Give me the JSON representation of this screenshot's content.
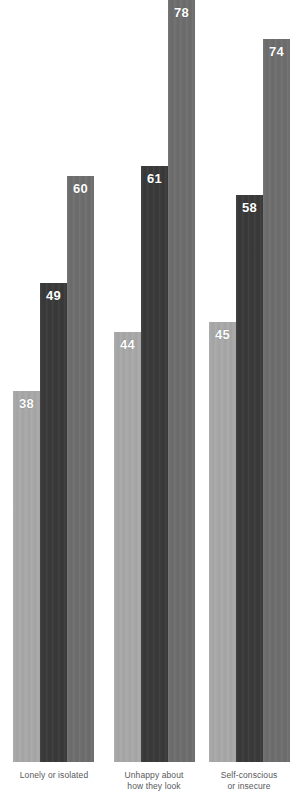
{
  "chart_data": {
    "type": "bar",
    "title": "",
    "subtitle": "",
    "xlabel": "",
    "ylabel": "",
    "ylim": [
      0,
      78
    ],
    "grid": false,
    "legend_position": "none",
    "orientation": "vertical",
    "grouped": true,
    "categories": [
      "Lonely or isolated",
      "Unhappy about how they look",
      "Self-conscious or insecure"
    ],
    "category_lines": [
      [
        "Lonely or isolated"
      ],
      [
        "Unhappy about",
        "how they look"
      ],
      [
        "Self-conscious",
        "or insecure"
      ]
    ],
    "series": [
      {
        "name": "series-1",
        "color": "#a8a8a8",
        "values": [
          38,
          44,
          45
        ]
      },
      {
        "name": "series-2",
        "color": "#3a3a3a",
        "values": [
          49,
          61,
          58
        ]
      },
      {
        "name": "series-3",
        "color": "#6e6e6e",
        "values": [
          60,
          78,
          74
        ]
      }
    ],
    "data_labels": [
      "38",
      "49",
      "60",
      "44",
      "61",
      "78",
      "45",
      "58",
      "74"
    ]
  },
  "groups": [
    {
      "label_lines": [
        "Lonely or isolated"
      ],
      "label_left": 0,
      "label_width": 108,
      "group_left": 13,
      "bars": [
        {
          "value": 38,
          "label": "38",
          "color": "#a8a8a8",
          "left": 0
        },
        {
          "value": 49,
          "label": "49",
          "color": "#3a3a3a",
          "left": 27
        },
        {
          "value": 60,
          "label": "60",
          "color": "#6e6e6e",
          "left": 54
        }
      ]
    },
    {
      "label_lines": [
        "Unhappy about",
        "how they look"
      ],
      "label_left": 100,
      "label_width": 108,
      "group_left": 114,
      "bars": [
        {
          "value": 44,
          "label": "44",
          "color": "#a8a8a8",
          "left": 0
        },
        {
          "value": 61,
          "label": "61",
          "color": "#3a3a3a",
          "left": 27
        },
        {
          "value": 78,
          "label": "78",
          "color": "#6e6e6e",
          "left": 54
        }
      ]
    },
    {
      "label_lines": [
        "Self-conscious",
        "or insecure"
      ],
      "label_left": 196,
      "label_width": 106,
      "group_left": 209,
      "bars": [
        {
          "value": 45,
          "label": "45",
          "color": "#a8a8a8",
          "left": 0
        },
        {
          "value": 58,
          "label": "58",
          "color": "#3a3a3a",
          "left": 27
        },
        {
          "value": 74,
          "label": "74",
          "color": "#6e6e6e",
          "left": 54
        }
      ]
    }
  ],
  "geometry": {
    "plot_height": 762,
    "max_value": 78,
    "bar_width": 27
  },
  "colors": {
    "light_gray": "#a8a8a8",
    "dark_gray": "#3a3a3a",
    "medium_gray": "#6e6e6e",
    "label_text": "#58595b",
    "value_text": "#ffffff",
    "background": "#ffffff"
  }
}
